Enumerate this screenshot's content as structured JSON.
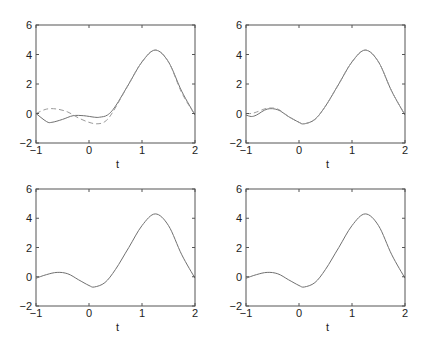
{
  "chart_data": [
    {
      "type": "line",
      "panel": "top-left",
      "xlabel": "t",
      "ylabel": "",
      "xlim": [
        -1,
        2
      ],
      "ylim": [
        -2,
        6
      ],
      "xticks": [
        "-1",
        "0",
        "1",
        "2"
      ],
      "yticks": [
        "-2",
        "0",
        "2",
        "4",
        "6"
      ],
      "grid": false,
      "series": [
        {
          "name": "true",
          "style": "solid",
          "x": [
            -1,
            -0.8,
            -0.7,
            -0.5,
            -0.3,
            -0.1,
            0.1,
            0.2,
            0.35,
            0.5,
            0.75,
            1.0,
            1.25,
            1.5,
            1.75,
            2.0
          ],
          "y": [
            0,
            -0.55,
            -0.6,
            -0.4,
            -0.15,
            -0.15,
            -0.25,
            -0.25,
            -0.1,
            0.5,
            2.0,
            3.5,
            4.3,
            3.5,
            1.5,
            -0.1
          ]
        },
        {
          "name": "estimate",
          "style": "dashed",
          "x": [
            -1,
            -0.8,
            -0.6,
            -0.4,
            -0.2,
            0,
            0.15,
            0.3,
            0.45,
            0.75,
            1.0,
            1.25,
            1.5,
            1.75,
            2.0
          ],
          "y": [
            0,
            0.3,
            0.3,
            0.1,
            -0.3,
            -0.6,
            -0.7,
            -0.55,
            0.1,
            2.0,
            3.5,
            4.3,
            3.5,
            1.4,
            -0.1
          ]
        }
      ]
    },
    {
      "type": "line",
      "panel": "top-right",
      "xlabel": "t",
      "ylabel": "",
      "xlim": [
        -1,
        2
      ],
      "ylim": [
        -2,
        6
      ],
      "xticks": [
        "-1",
        "0",
        "1",
        "2"
      ],
      "yticks": [
        "-2",
        "0",
        "2",
        "4",
        "6"
      ],
      "grid": false,
      "series": [
        {
          "name": "true",
          "style": "solid",
          "x": [
            -1,
            -0.9,
            -0.8,
            -0.6,
            -0.4,
            -0.2,
            0,
            0.1,
            0.3,
            0.5,
            0.75,
            1.0,
            1.25,
            1.5,
            1.75,
            2.0
          ],
          "y": [
            -0.1,
            -0.2,
            -0.1,
            0.3,
            0.25,
            -0.2,
            -0.6,
            -0.7,
            -0.4,
            0.5,
            2.0,
            3.5,
            4.3,
            3.5,
            1.5,
            -0.1
          ]
        },
        {
          "name": "estimate",
          "style": "dashed",
          "x": [
            -1,
            -0.9,
            -0.8,
            -0.6,
            -0.4,
            -0.2,
            0,
            0.1,
            0.3,
            0.5,
            0.75,
            1.0,
            1.25,
            1.5,
            1.75,
            2.0
          ],
          "y": [
            0,
            0.0,
            0.1,
            0.35,
            0.3,
            -0.2,
            -0.6,
            -0.7,
            -0.4,
            0.5,
            2.0,
            3.5,
            4.3,
            3.5,
            1.5,
            -0.1
          ]
        }
      ]
    },
    {
      "type": "line",
      "panel": "bottom-left",
      "xlabel": "t",
      "ylabel": "",
      "xlim": [
        -1,
        2
      ],
      "ylim": [
        -2,
        6
      ],
      "xticks": [
        "-1",
        "0",
        "1",
        "2"
      ],
      "yticks": [
        "-2",
        "0",
        "2",
        "4",
        "6"
      ],
      "grid": false,
      "series": [
        {
          "name": "true",
          "style": "solid",
          "x": [
            -1,
            -0.8,
            -0.6,
            -0.4,
            -0.2,
            0,
            0.1,
            0.3,
            0.5,
            0.75,
            1.0,
            1.25,
            1.5,
            1.75,
            2.0
          ],
          "y": [
            -0.1,
            0.15,
            0.3,
            0.2,
            -0.2,
            -0.6,
            -0.7,
            -0.4,
            0.5,
            2.0,
            3.5,
            4.3,
            3.5,
            1.5,
            -0.1
          ]
        }
      ]
    },
    {
      "type": "line",
      "panel": "bottom-right",
      "xlabel": "t",
      "ylabel": "",
      "xlim": [
        -1,
        2
      ],
      "ylim": [
        -2,
        6
      ],
      "xticks": [
        "-1",
        "0",
        "1",
        "2"
      ],
      "yticks": [
        "-2",
        "0",
        "2",
        "4",
        "6"
      ],
      "grid": false,
      "series": [
        {
          "name": "true",
          "style": "solid",
          "x": [
            -1,
            -0.8,
            -0.6,
            -0.4,
            -0.2,
            0,
            0.1,
            0.3,
            0.5,
            0.75,
            1.0,
            1.25,
            1.5,
            1.75,
            2.0
          ],
          "y": [
            -0.1,
            0.15,
            0.3,
            0.2,
            -0.2,
            -0.6,
            -0.7,
            -0.4,
            0.5,
            2.0,
            3.5,
            4.3,
            3.5,
            1.5,
            -0.1
          ]
        }
      ]
    }
  ],
  "colors": {
    "line": "#707070",
    "axis": "#555555",
    "text": "#222222"
  },
  "layout": {
    "panels": [
      {
        "left": 36,
        "top": 25,
        "right": 195,
        "bottom": 143
      },
      {
        "left": 246,
        "top": 25,
        "right": 405,
        "bottom": 143
      },
      {
        "left": 36,
        "top": 189,
        "right": 195,
        "bottom": 306
      },
      {
        "left": 246,
        "top": 189,
        "right": 405,
        "bottom": 306
      }
    ]
  }
}
